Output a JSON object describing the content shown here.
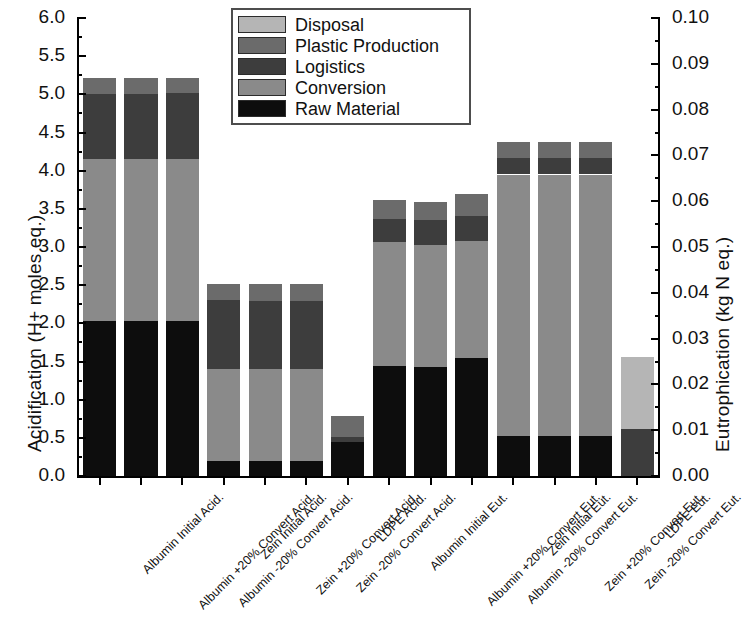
{
  "chart_data": {
    "type": "bar",
    "title": "",
    "subtitle": "",
    "stacked": true,
    "categories": [
      "Albumin Initial Acid.",
      "Albumin +20% Convert Acid.",
      "Albumin -20% Convert Acid.",
      "Zein Initial Acid.",
      "Zein +20% Convert Acid.",
      "Zein -20% Convert Acid.",
      "LDPE Acid.",
      "Albumin Initial Eut.",
      "Albumin +20% Convert Eut.",
      "Albumin -20% Convert Eut.",
      "Zein Initial Eut.",
      "Zein +20% Convert Eut.",
      "Zein -20% Convert Eut.",
      "LDPE Eut."
    ],
    "series": [
      {
        "name": "Raw Material",
        "color": "#0d0d0d",
        "values": [
          2.03,
          2.03,
          2.03,
          0.2,
          0.2,
          0.2,
          0.45,
          1.44,
          1.43,
          1.55,
          0.52,
          0.52,
          0.52,
          0.0
        ]
      },
      {
        "name": "Conversion",
        "color": "#8a8a8a",
        "values": [
          2.12,
          2.12,
          2.12,
          1.2,
          1.2,
          1.2,
          0.0,
          1.62,
          1.6,
          1.53,
          3.43,
          3.43,
          3.43,
          0.0
        ]
      },
      {
        "name": "Logistics",
        "color": "#3d3d3d",
        "values": [
          0.85,
          0.85,
          0.87,
          0.9,
          0.89,
          0.89,
          0.06,
          0.31,
          0.32,
          0.32,
          0.22,
          0.22,
          0.22,
          0.62
        ]
      },
      {
        "name": "Plastic Production",
        "color": "#6b6b6b",
        "values": [
          0.22,
          0.22,
          0.2,
          0.22,
          0.23,
          0.23,
          0.28,
          0.25,
          0.24,
          0.3,
          0.21,
          0.21,
          0.21,
          0.0
        ]
      },
      {
        "name": "Disposal",
        "color": "#b5b5b5",
        "values": [
          0.0,
          0.0,
          0.0,
          0.0,
          0.0,
          0.0,
          0.0,
          0.0,
          0.0,
          0.0,
          0.0,
          0.0,
          0.0,
          0.94
        ]
      }
    ],
    "left_axis": {
      "label": "Acidification (H+ moles eq.)",
      "min": 0.0,
      "max": 6.0,
      "step": 0.5,
      "ticks": [
        "0.0",
        "0.5",
        "1.0",
        "1.5",
        "2.0",
        "2.5",
        "3.0",
        "3.5",
        "4.0",
        "4.5",
        "5.0",
        "5.5",
        "6.0"
      ]
    },
    "right_axis": {
      "label": "Eutrophication (kg N eq.)",
      "min": 0.0,
      "max": 0.1,
      "step": 0.01,
      "ticks": [
        "0.00",
        "0.01",
        "0.02",
        "0.03",
        "0.04",
        "0.05",
        "0.06",
        "0.07",
        "0.08",
        "0.09",
        "0.10"
      ]
    },
    "legend": {
      "position": "top-center",
      "entries": [
        {
          "label": "Disposal",
          "color": "#b5b5b5"
        },
        {
          "label": "Plastic Production",
          "color": "#6b6b6b"
        },
        {
          "label": "Logistics",
          "color": "#3d3d3d"
        },
        {
          "label": "Conversion",
          "color": "#8a8a8a"
        },
        {
          "label": "Raw Material",
          "color": "#0d0d0d"
        }
      ]
    },
    "grid": false
  },
  "caption": {
    "text": ""
  }
}
